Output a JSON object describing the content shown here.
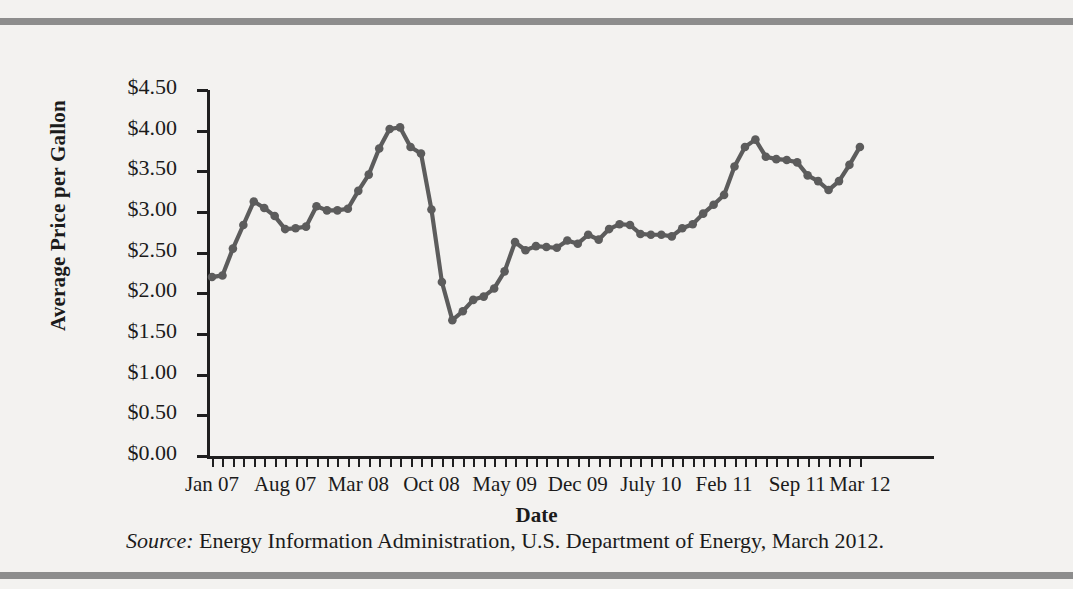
{
  "figure": {
    "y_axis_title": "Average Price per Gallon",
    "x_axis_title": "Date",
    "source_label": "Source:",
    "source_text": " Energy Information Administration, U.S. Department of Energy, March 2012."
  },
  "chart_data": {
    "type": "line",
    "title": "",
    "xlabel": "Date",
    "ylabel": "Average Price per Gallon",
    "ylim": [
      0,
      4.5
    ],
    "ytick_labels": [
      "$0.00",
      "$0.50",
      "$1.00",
      "$1.50",
      "$2.00",
      "$2.50",
      "$3.00",
      "$3.50",
      "$4.00",
      "$4.50"
    ],
    "ytick_values": [
      0,
      0.5,
      1.0,
      1.5,
      2.0,
      2.5,
      3.0,
      3.5,
      4.0,
      4.5
    ],
    "xtick_labels": [
      "Jan 07",
      "Aug 07",
      "Mar 08",
      "Oct 08",
      "May 09",
      "Dec 09",
      "July 10",
      "Feb 11",
      "Sep 11",
      "Mar 12"
    ],
    "xtick_indices": [
      0,
      7,
      14,
      21,
      28,
      35,
      42,
      49,
      56,
      62
    ],
    "grid": false,
    "legend": "none",
    "marker": "circle",
    "line_color": "#5c5c5c",
    "x": [
      "Jan 07",
      "Feb 07",
      "Mar 07",
      "Apr 07",
      "May 07",
      "Jun 07",
      "Jul 07",
      "Aug 07",
      "Sep 07",
      "Oct 07",
      "Nov 07",
      "Dec 07",
      "Jan 08",
      "Feb 08",
      "Mar 08",
      "Apr 08",
      "May 08",
      "Jun 08",
      "Jul 08",
      "Aug 08",
      "Sep 08",
      "Oct 08",
      "Nov 08",
      "Dec 08",
      "Jan 09",
      "Feb 09",
      "Mar 09",
      "Apr 09",
      "May 09",
      "Jun 09",
      "Jul 09",
      "Aug 09",
      "Sep 09",
      "Oct 09",
      "Nov 09",
      "Dec 09",
      "Jan 10",
      "Feb 10",
      "Mar 10",
      "Apr 10",
      "May 10",
      "Jun 10",
      "July 10",
      "Aug 10",
      "Sep 10",
      "Oct 10",
      "Nov 10",
      "Dec 10",
      "Jan 11",
      "Feb 11",
      "Mar 11",
      "Apr 11",
      "May 11",
      "Jun 11",
      "Jul 11",
      "Aug 11",
      "Sep 11",
      "Oct 11",
      "Nov 11",
      "Dec 11",
      "Jan 12",
      "Feb 12",
      "Mar 12"
    ],
    "values": [
      2.2,
      2.22,
      2.55,
      2.84,
      3.13,
      3.05,
      2.95,
      2.79,
      2.8,
      2.82,
      3.07,
      3.02,
      3.02,
      3.04,
      3.26,
      3.46,
      3.78,
      4.02,
      4.04,
      3.8,
      3.72,
      3.03,
      2.14,
      1.67,
      1.78,
      1.92,
      1.96,
      2.06,
      2.27,
      2.63,
      2.53,
      2.58,
      2.57,
      2.56,
      2.65,
      2.61,
      2.72,
      2.66,
      2.79,
      2.85,
      2.84,
      2.73,
      2.72,
      2.72,
      2.7,
      2.8,
      2.85,
      2.98,
      3.09,
      3.21,
      3.56,
      3.8,
      3.89,
      3.68,
      3.65,
      3.64,
      3.61,
      3.45,
      3.38,
      3.27,
      3.38,
      3.58,
      3.8
    ]
  }
}
